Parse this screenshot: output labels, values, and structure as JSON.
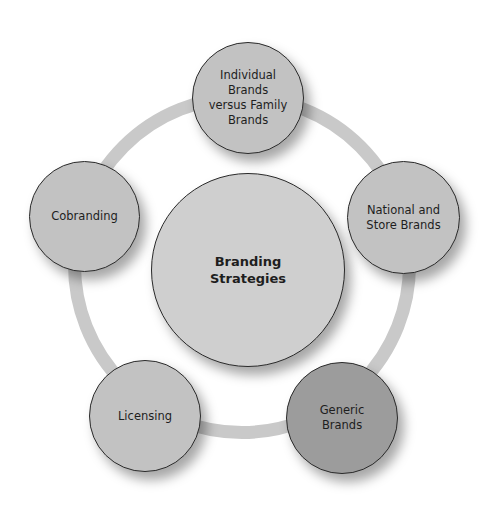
{
  "diagram": {
    "center": {
      "label": "Branding\nStrategies"
    },
    "nodes": [
      {
        "label": "Individual Brands versus Family Brands",
        "color": "#c2c2c2"
      },
      {
        "label": "National and Store Brands",
        "color": "#c2c2c2"
      },
      {
        "label": "Generic Brands",
        "color": "#9c9c9c"
      },
      {
        "label": "Licensing",
        "color": "#c2c2c2"
      },
      {
        "label": "Cobranding",
        "color": "#c2c2c2"
      }
    ],
    "ring_color": "#c9c9c9"
  }
}
